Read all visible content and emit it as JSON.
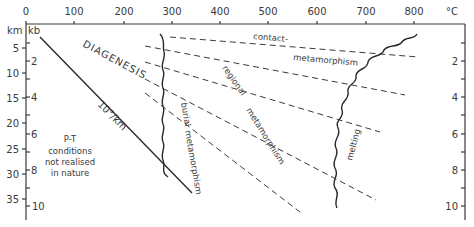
{
  "diagram": {
    "colors": {
      "ink": "#3a3a3a",
      "background": "#ffffff"
    },
    "top_axis": {
      "unit": "°C",
      "ticks": [
        "0",
        "100",
        "200",
        "300",
        "400",
        "500",
        "600",
        "700",
        "800"
      ]
    },
    "left_axis": {
      "unit_depth": "km",
      "unit_pressure": "kb",
      "depth_ticks": [
        "5",
        "10",
        "15",
        "20",
        "25",
        "30",
        "35"
      ],
      "pressure_ticks": [
        "2",
        "4",
        "6",
        "8",
        "10"
      ]
    },
    "right_axis": {
      "pressure_ticks": [
        "2",
        "4",
        "6",
        "8",
        "10"
      ]
    },
    "labels": {
      "diagenesis": "DIAGENESIS",
      "gradient": "10°/km",
      "pt_line1": "P-T",
      "pt_line2": "conditions",
      "pt_line3": "not realised",
      "pt_line4": "in nature",
      "contact": "contact-",
      "contact_meta": "metamorphism",
      "regional": "regional",
      "regional_meta": "metamorphism",
      "burial": "burial",
      "burial_meta": "metamorphism",
      "melting": "melting"
    }
  }
}
